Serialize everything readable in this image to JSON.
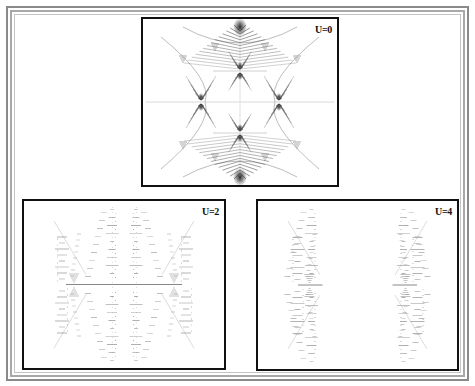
{
  "figure": {
    "colors": {
      "frame": "#8a8a8a",
      "panel_border": "#111111",
      "pattern": "#555555",
      "background": "#ffffff"
    },
    "panels": [
      {
        "id": "u0",
        "label": "U=0",
        "position": "top-center",
        "style": "continuous-butterfly"
      },
      {
        "id": "u2",
        "label": "U=2",
        "position": "bottom-left",
        "style": "dotted-butterfly-connected"
      },
      {
        "id": "u4",
        "label": "U=4",
        "position": "bottom-right",
        "style": "dotted-butterfly-split"
      }
    ]
  }
}
